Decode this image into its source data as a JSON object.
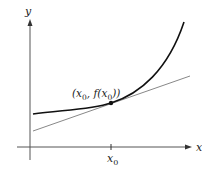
{
  "diagram": {
    "axes": {
      "x_label": "x",
      "y_label": "y"
    },
    "tick": {
      "label_base": "x",
      "label_sub": "0"
    },
    "point": {
      "label_open": "(x",
      "label_sub1": "0",
      "label_mid": ", f(x",
      "label_sub2": "0",
      "label_close": "))"
    },
    "colors": {
      "axis": "#555555",
      "curve": "#111111",
      "tangent": "#888888",
      "point": "#111111"
    }
  }
}
